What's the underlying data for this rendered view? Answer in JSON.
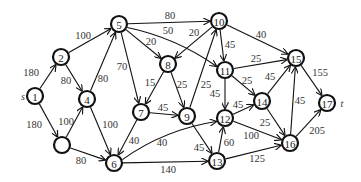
{
  "diagram": {
    "type": "directed-weighted-graph",
    "source_label": "s",
    "sink_label": "t",
    "node_radius": 8,
    "nodes": [
      {
        "id": "1",
        "label": "1",
        "x": 35,
        "y": 96,
        "thick": true
      },
      {
        "id": "2",
        "label": "2",
        "x": 61,
        "y": 57
      },
      {
        "id": "3",
        "label": "",
        "x": 62,
        "y": 145
      },
      {
        "id": "4",
        "label": "4",
        "x": 87,
        "y": 99
      },
      {
        "id": "5",
        "label": "5",
        "x": 119,
        "y": 24
      },
      {
        "id": "6",
        "label": "6",
        "x": 114,
        "y": 163
      },
      {
        "id": "7",
        "label": "7",
        "x": 141,
        "y": 112
      },
      {
        "id": "8",
        "label": "8",
        "x": 168,
        "y": 64
      },
      {
        "id": "9",
        "label": "9",
        "x": 187,
        "y": 116
      },
      {
        "id": "10",
        "label": "10",
        "x": 219,
        "y": 21
      },
      {
        "id": "11",
        "label": "11",
        "x": 225,
        "y": 70
      },
      {
        "id": "12",
        "label": "12",
        "x": 225,
        "y": 118
      },
      {
        "id": "13",
        "label": "13",
        "x": 217,
        "y": 161
      },
      {
        "id": "14",
        "label": "14",
        "x": 262,
        "y": 101
      },
      {
        "id": "15",
        "label": "15",
        "x": 296,
        "y": 58
      },
      {
        "id": "16",
        "label": "16",
        "x": 290,
        "y": 143
      },
      {
        "id": "17",
        "label": "17",
        "x": 327,
        "y": 103,
        "thick": true
      }
    ],
    "edges": [
      {
        "from": "1",
        "to": "2",
        "weight": "180",
        "lx": 31,
        "ly": 72
      },
      {
        "from": "1",
        "to": "3",
        "weight": "180",
        "lx": 34,
        "ly": 124
      },
      {
        "from": "2",
        "to": "5",
        "weight": "100",
        "lx": 83,
        "ly": 35
      },
      {
        "from": "2",
        "to": "4",
        "weight": "80",
        "lx": 66,
        "ly": 80
      },
      {
        "from": "3",
        "to": "4",
        "weight": "100",
        "lx": 66,
        "ly": 121
      },
      {
        "from": "3",
        "to": "6",
        "weight": "80",
        "lx": 81,
        "ly": 160
      },
      {
        "from": "4",
        "to": "5",
        "weight": "80",
        "lx": 103,
        "ly": 78
      },
      {
        "from": "4",
        "to": "6",
        "weight": "100",
        "lx": 110,
        "ly": 124
      },
      {
        "from": "5",
        "to": "10",
        "weight": "80",
        "lx": 170,
        "ly": 15
      },
      {
        "from": "5",
        "to": "11",
        "weight": "50",
        "lx": 168,
        "ly": 30,
        "curve": -10
      },
      {
        "from": "5",
        "to": "8",
        "weight": "20",
        "lx": 151,
        "ly": 41
      },
      {
        "from": "5",
        "to": "7",
        "weight": "70",
        "lx": 122,
        "ly": 66
      },
      {
        "from": "10",
        "to": "8",
        "weight": "20",
        "lx": 194,
        "ly": 32
      },
      {
        "from": "10",
        "to": "11",
        "weight": "45",
        "lx": 230,
        "ly": 44
      },
      {
        "from": "10",
        "to": "15",
        "weight": "40",
        "lx": 261,
        "ly": 34
      },
      {
        "from": "8",
        "to": "7",
        "weight": "15",
        "lx": 150,
        "ly": 82
      },
      {
        "from": "8",
        "to": "9",
        "weight": "25",
        "lx": 182,
        "ly": 84
      },
      {
        "from": "9",
        "to": "10",
        "weight": "25",
        "lx": 206,
        "ly": 84
      },
      {
        "from": "7",
        "to": "9",
        "weight": "45",
        "lx": 163,
        "ly": 107
      },
      {
        "from": "7",
        "to": "6",
        "weight": "40",
        "lx": 134,
        "ly": 140
      },
      {
        "from": "6",
        "to": "12",
        "weight": "40",
        "lx": 162,
        "ly": 142,
        "curve": -12
      },
      {
        "from": "6",
        "to": "13",
        "weight": "140",
        "lx": 168,
        "ly": 169
      },
      {
        "from": "9",
        "to": "13",
        "weight": "45",
        "lx": 199,
        "ly": 147
      },
      {
        "from": "13",
        "to": "12",
        "weight": "60",
        "lx": 229,
        "ly": 142
      },
      {
        "from": "11",
        "to": "12",
        "weight": "45",
        "lx": 215,
        "ly": 93
      },
      {
        "from": "11",
        "to": "15",
        "weight": "25",
        "lx": 256,
        "ly": 58
      },
      {
        "from": "11",
        "to": "14",
        "weight": "25",
        "lx": 247,
        "ly": 80
      },
      {
        "from": "12",
        "to": "14",
        "weight": "45",
        "lx": 238,
        "ly": 104
      },
      {
        "from": "12",
        "to": "16",
        "weight": "100",
        "lx": 251,
        "ly": 135
      },
      {
        "from": "14",
        "to": "15",
        "weight": "45",
        "lx": 270,
        "ly": 76
      },
      {
        "from": "14",
        "to": "16",
        "weight": "25",
        "lx": 265,
        "ly": 122
      },
      {
        "from": "16",
        "to": "15",
        "weight": "45",
        "lx": 300,
        "ly": 100
      },
      {
        "from": "13",
        "to": "16",
        "weight": "125",
        "lx": 257,
        "ly": 158
      },
      {
        "from": "15",
        "to": "17",
        "weight": "155",
        "lx": 320,
        "ly": 72
      },
      {
        "from": "16",
        "to": "17",
        "weight": "205",
        "lx": 317,
        "ly": 130
      }
    ]
  }
}
